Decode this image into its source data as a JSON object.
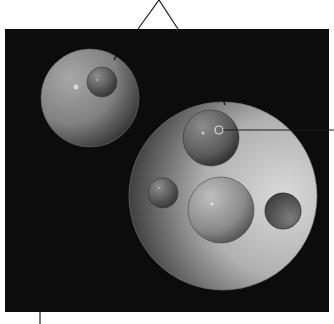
{
  "diagram": {
    "type": "nested-spheres-illustration",
    "canvas": {
      "width": 334,
      "height": 324,
      "background": "#ffffff"
    },
    "panel": {
      "x": 5,
      "y": 29,
      "width": 324,
      "height": 283,
      "fill": "#0c0c0c"
    },
    "pointers": [
      {
        "name": "top-triangle-pointer",
        "points": "138,29 159,0 178,29"
      },
      {
        "name": "right-leader-line",
        "x1": 222,
        "y1": 130,
        "x2": 334,
        "y2": 130
      },
      {
        "name": "bottom-leader-line",
        "x1": 40,
        "y1": 312,
        "x2": 40,
        "y2": 324
      }
    ],
    "spheres": [
      {
        "name": "left-large-sphere",
        "cx": 90,
        "cy": 98,
        "r": 49,
        "light": "#a8a8a8",
        "dark": "#2a2a2a"
      },
      {
        "name": "left-inner-sphere",
        "cx": 102,
        "cy": 82,
        "r": 15,
        "light": "#909090",
        "dark": "#2e2e2e"
      },
      {
        "name": "right-large-sphere",
        "cx": 223,
        "cy": 196,
        "r": 94,
        "light": "#d6d6d6",
        "dark": "#1e1e1e"
      },
      {
        "name": "top-inner-sphere",
        "cx": 211,
        "cy": 138,
        "r": 28,
        "light": "#8a8a8a",
        "dark": "#222222"
      },
      {
        "name": "small-left-sphere",
        "cx": 163,
        "cy": 193,
        "r": 15,
        "light": "#8c8c8c",
        "dark": "#2a2a2a"
      },
      {
        "name": "middle-sphere",
        "cx": 221,
        "cy": 210,
        "r": 33,
        "light": "#bdbdbd",
        "dark": "#3a3a3a"
      },
      {
        "name": "right-small-sphere",
        "cx": 283,
        "cy": 211,
        "r": 18,
        "light": "#6a6a6a",
        "dark": "#444444"
      }
    ],
    "highlights": [
      {
        "name": "left-sphere-highlight",
        "cx": 76,
        "cy": 87,
        "r": 2.5
      },
      {
        "name": "left-inner-highlight",
        "cx": 97,
        "cy": 80,
        "r": 1
      },
      {
        "name": "top-inner-highlight",
        "cx": 203,
        "cy": 133,
        "r": 1.5
      },
      {
        "name": "small-left-highlight",
        "cx": 159,
        "cy": 188,
        "r": 1
      },
      {
        "name": "middle-sphere-highlight",
        "cx": 212,
        "cy": 204,
        "r": 1.5
      }
    ],
    "ring": {
      "name": "target-ring",
      "cx": 219,
      "cy": 130,
      "r": 4,
      "stroke": "#e0e0e0"
    },
    "ticks": [
      {
        "name": "left-sphere-tick",
        "x1": 114,
        "y1": 60,
        "x2": 116,
        "y2": 56
      },
      {
        "name": "right-sphere-tick",
        "x1": 223,
        "y1": 100,
        "x2": 225,
        "y2": 105
      }
    ]
  }
}
